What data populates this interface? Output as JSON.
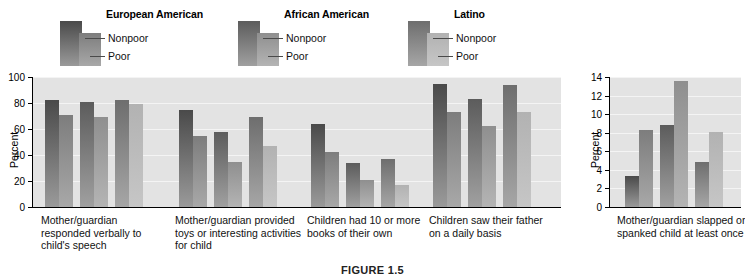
{
  "legend": {
    "groups": [
      {
        "title": "European American",
        "nonpoor": "Nonpoor",
        "poor": "Poor"
      },
      {
        "title": "African American",
        "nonpoor": "Nonpoor",
        "poor": "Poor"
      },
      {
        "title": "Latino",
        "nonpoor": "Nonpoor",
        "poor": "Poor"
      }
    ]
  },
  "caption": "FIGURE 1.5",
  "colors": {
    "ea_nonpoor_top": "#4a4a4a",
    "ea_nonpoor_bottom": "#9a9a9a",
    "ea_poor_top": "#7d7d7d",
    "ea_poor_bottom": "#a8a8a8",
    "aa_nonpoor_top": "#5c5c5c",
    "aa_nonpoor_bottom": "#a0a0a0",
    "aa_poor_top": "#8f8f8f",
    "aa_poor_bottom": "#b4b4b4",
    "la_nonpoor_top": "#6e6e6e",
    "la_nonpoor_bottom": "#a6a6a6",
    "la_poor_top": "#b2b2b2",
    "la_poor_bottom": "#c6c6c6",
    "plot_bg": "#e3e3e3",
    "gridline": "#f4f4f4",
    "axis": "#000000"
  },
  "chart_data": [
    {
      "type": "bar",
      "title": "",
      "xlabel": "",
      "ylabel": "Percent",
      "ylim": [
        0,
        100
      ],
      "yticks": [
        0,
        20,
        40,
        60,
        80,
        100
      ],
      "grid": true,
      "legend_position": "top",
      "categories": [
        "Mother/guardian responded verbally to child's speech",
        "Mother/guardian provided toys or interesting activities for child",
        "Children had 10 or more books of their own",
        "Children saw their father on a daily basis"
      ],
      "series": [
        {
          "name": "European American Nonpoor",
          "values": [
            82,
            75,
            64,
            95
          ]
        },
        {
          "name": "European American Poor",
          "values": [
            71,
            55,
            42,
            73
          ]
        },
        {
          "name": "African American Nonpoor",
          "values": [
            81,
            58,
            34,
            83
          ]
        },
        {
          "name": "African American Poor",
          "values": [
            69,
            35,
            21,
            62
          ]
        },
        {
          "name": "Latino Nonpoor",
          "values": [
            82,
            69,
            37,
            94
          ]
        },
        {
          "name": "Latino Poor",
          "values": [
            79,
            47,
            17,
            73
          ]
        }
      ]
    },
    {
      "type": "bar",
      "title": "",
      "xlabel": "",
      "ylabel": "Percent",
      "ylim": [
        0,
        14
      ],
      "yticks": [
        0,
        2,
        4,
        6,
        8,
        10,
        12,
        14
      ],
      "grid": true,
      "legend_position": "top",
      "categories": [
        "Mother/guardian slapped or spanked child at least once"
      ],
      "series": [
        {
          "name": "European American Nonpoor",
          "values": [
            3.3
          ]
        },
        {
          "name": "European American Poor",
          "values": [
            8.3
          ]
        },
        {
          "name": "African American Nonpoor",
          "values": [
            8.8
          ]
        },
        {
          "name": "African American Poor",
          "values": [
            13.6
          ]
        },
        {
          "name": "Latino Nonpoor",
          "values": [
            4.8
          ]
        },
        {
          "name": "Latino Poor",
          "values": [
            8.1
          ]
        }
      ]
    }
  ]
}
